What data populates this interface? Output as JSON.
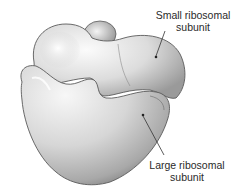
{
  "figure": {
    "labels": [
      {
        "id": "small",
        "line1": "Small ribosomal",
        "line2": "subunit"
      },
      {
        "id": "large",
        "line1": "Large ribosomal",
        "line2": "subunit"
      }
    ],
    "colors": {
      "background": "#ffffff",
      "shape_light": "#f2f2f2",
      "shape_mid": "#c9c9c9",
      "shape_dark": "#8c8c8c",
      "outline": "#5a5a5a",
      "text": "#2a2a2a",
      "leader_line": "#333333"
    }
  }
}
